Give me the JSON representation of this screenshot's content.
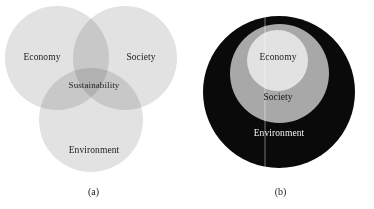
{
  "figure": {
    "panel_a": {
      "caption": "(a)",
      "type": "venn-diagram",
      "circles": [
        {
          "name": "economy",
          "label": "Economy",
          "color": "#e2e2e2"
        },
        {
          "name": "society",
          "label": "Society",
          "color": "#e2e2e2"
        },
        {
          "name": "environment",
          "label": "Environment",
          "color": "#e2e2e2"
        }
      ],
      "intersection_label": "Sustainability"
    },
    "panel_b": {
      "caption": "(b)",
      "type": "nested-circles",
      "circles": [
        {
          "name": "environment",
          "label": "Environment",
          "color": "#0a0a0a",
          "level": "outer"
        },
        {
          "name": "society",
          "label": "Society",
          "color": "#a8a8a8",
          "level": "middle"
        },
        {
          "name": "economy",
          "label": "Economy",
          "color": "#e2e2e2",
          "level": "inner"
        }
      ]
    }
  }
}
